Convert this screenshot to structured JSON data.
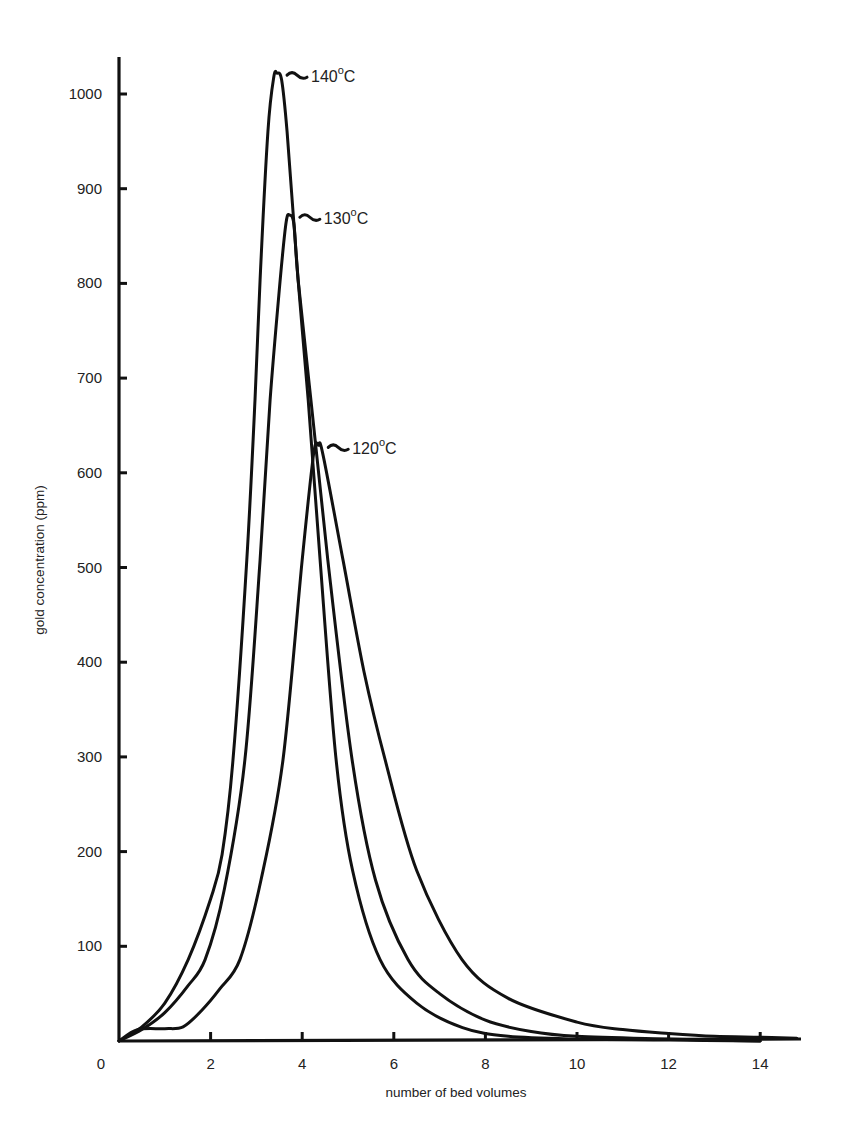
{
  "chart_data": {
    "type": "line",
    "title": "",
    "xlabel": "number of bed volumes",
    "ylabel": "gold concentration (ppm)",
    "xlim": [
      0,
      15
    ],
    "ylim": [
      0,
      1050
    ],
    "x_ticks": [
      0,
      2,
      4,
      6,
      8,
      10,
      12,
      14
    ],
    "x_tick_labels": [
      "0",
      "2",
      "4",
      "6",
      "8",
      "10",
      "12",
      "14"
    ],
    "y_ticks": [
      100,
      200,
      300,
      400,
      500,
      600,
      700,
      800,
      900,
      1000
    ],
    "y_tick_labels": [
      "100",
      "200",
      "300",
      "400",
      "500",
      "600",
      "700",
      "800",
      "900",
      "1000"
    ],
    "grid": false,
    "legend": "inline labels at peaks",
    "series": [
      {
        "name": "140°C",
        "label_base": "140",
        "label_unit": "C",
        "peak": {
          "x": 3.45,
          "y": 1022
        },
        "points": [
          [
            0,
            0
          ],
          [
            0.5,
            15
          ],
          [
            1.0,
            40
          ],
          [
            1.51,
            86
          ],
          [
            2.0,
            150
          ],
          [
            2.25,
            197
          ],
          [
            2.49,
            297
          ],
          [
            2.79,
            508
          ],
          [
            2.97,
            677
          ],
          [
            3.08,
            804
          ],
          [
            3.25,
            960
          ],
          [
            3.38,
            1018
          ],
          [
            3.45,
            1022
          ],
          [
            3.55,
            1015
          ],
          [
            3.67,
            960
          ],
          [
            3.91,
            804
          ],
          [
            4.13,
            677
          ],
          [
            4.39,
            508
          ],
          [
            4.74,
            297
          ],
          [
            5.1,
            180
          ],
          [
            5.7,
            86
          ],
          [
            6.5,
            40
          ],
          [
            7.5,
            14
          ],
          [
            8.5,
            5
          ],
          [
            10,
            2
          ],
          [
            12,
            1
          ],
          [
            14,
            0
          ]
        ]
      },
      {
        "name": "130°C",
        "label_base": "130",
        "label_unit": "C",
        "peak": {
          "x": 3.73,
          "y": 872
        },
        "points": [
          [
            0,
            0
          ],
          [
            0.5,
            12
          ],
          [
            1.0,
            30
          ],
          [
            1.5,
            58
          ],
          [
            1.88,
            86
          ],
          [
            2.3,
            160
          ],
          [
            2.75,
            297
          ],
          [
            3.08,
            508
          ],
          [
            3.3,
            677
          ],
          [
            3.52,
            804
          ],
          [
            3.65,
            865
          ],
          [
            3.73,
            872
          ],
          [
            3.82,
            862
          ],
          [
            3.91,
            804
          ],
          [
            4.19,
            677
          ],
          [
            4.56,
            508
          ],
          [
            5.09,
            297
          ],
          [
            5.6,
            170
          ],
          [
            6.31,
            86
          ],
          [
            7.0,
            50
          ],
          [
            8.0,
            22
          ],
          [
            9.0,
            10
          ],
          [
            10,
            5
          ],
          [
            12,
            2
          ],
          [
            14,
            0
          ]
        ]
      },
      {
        "name": "120°C",
        "label_base": "120",
        "label_unit": "C",
        "peak": {
          "x": 4.35,
          "y": 629
        },
        "points": [
          [
            0,
            0
          ],
          [
            0.4,
            12
          ],
          [
            1.0,
            13
          ],
          [
            1.4,
            15
          ],
          [
            1.8,
            32
          ],
          [
            2.2,
            55
          ],
          [
            2.64,
            86
          ],
          [
            3.1,
            170
          ],
          [
            3.58,
            297
          ],
          [
            4.0,
            508
          ],
          [
            4.25,
            620
          ],
          [
            4.35,
            629
          ],
          [
            4.45,
            620
          ],
          [
            4.89,
            508
          ],
          [
            5.35,
            390
          ],
          [
            5.81,
            297
          ],
          [
            6.5,
            180
          ],
          [
            7.49,
            86
          ],
          [
            8.5,
            45
          ],
          [
            10,
            20
          ],
          [
            11,
            12
          ],
          [
            12,
            8
          ],
          [
            13,
            5
          ],
          [
            14,
            4
          ],
          [
            14.8,
            3
          ]
        ]
      }
    ]
  }
}
